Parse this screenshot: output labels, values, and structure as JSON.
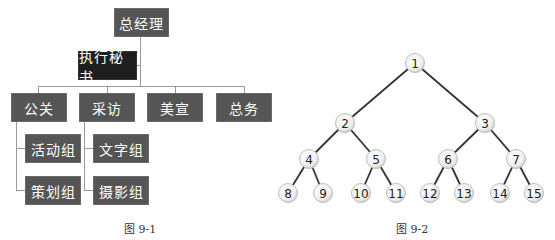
{
  "figure1": {
    "caption": "图 9-1",
    "root": {
      "label": "总经理"
    },
    "assistant": {
      "label": "执行秘书"
    },
    "departments": [
      {
        "label": "公关",
        "children": [
          {
            "label": "活动组"
          },
          {
            "label": "策划组"
          }
        ]
      },
      {
        "label": "采访",
        "children": [
          {
            "label": "文字组"
          },
          {
            "label": "摄影组"
          }
        ]
      },
      {
        "label": "美宣",
        "children": []
      },
      {
        "label": "总务",
        "children": []
      }
    ],
    "colors": {
      "box": "#555555",
      "assistant_box": "#1e1e1e",
      "line": "#9a9a9a",
      "text": "#ffffff"
    }
  },
  "figure2": {
    "caption": "图 9-2",
    "type": "complete binary tree",
    "nodes": [
      {
        "id": "1",
        "x": 415,
        "y": 63
      },
      {
        "id": "2",
        "x": 345,
        "y": 123
      },
      {
        "id": "3",
        "x": 485,
        "y": 123
      },
      {
        "id": "4",
        "x": 309,
        "y": 159
      },
      {
        "id": "5",
        "x": 376,
        "y": 159
      },
      {
        "id": "6",
        "x": 448,
        "y": 159
      },
      {
        "id": "7",
        "x": 516,
        "y": 159
      },
      {
        "id": "8",
        "x": 288,
        "y": 193
      },
      {
        "id": "9",
        "x": 323,
        "y": 193
      },
      {
        "id": "10",
        "x": 361,
        "y": 193
      },
      {
        "id": "11",
        "x": 396,
        "y": 193
      },
      {
        "id": "12",
        "x": 430,
        "y": 193
      },
      {
        "id": "13",
        "x": 464,
        "y": 193
      },
      {
        "id": "14",
        "x": 500,
        "y": 193
      },
      {
        "id": "15",
        "x": 534,
        "y": 193
      }
    ],
    "edges": [
      [
        "1",
        "2"
      ],
      [
        "1",
        "3"
      ],
      [
        "2",
        "4"
      ],
      [
        "2",
        "5"
      ],
      [
        "3",
        "6"
      ],
      [
        "3",
        "7"
      ],
      [
        "4",
        "8"
      ],
      [
        "4",
        "9"
      ],
      [
        "5",
        "10"
      ],
      [
        "5",
        "11"
      ],
      [
        "6",
        "12"
      ],
      [
        "6",
        "13"
      ],
      [
        "7",
        "14"
      ],
      [
        "7",
        "15"
      ]
    ],
    "colors": {
      "edge": "#333333",
      "node_fill": "#f2f2f2",
      "node_stroke": "#b0b0b0",
      "text": "#222222"
    }
  }
}
